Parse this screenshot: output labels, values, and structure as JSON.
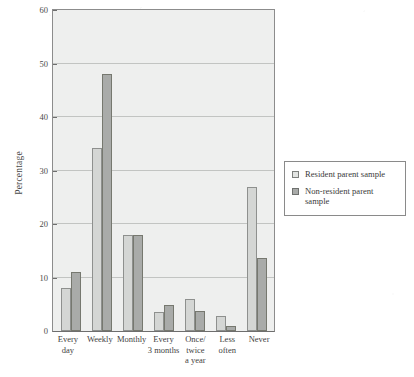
{
  "chart_data": {
    "type": "bar",
    "title": "",
    "xlabel": "",
    "ylabel": "Percentage",
    "ylim": [
      0,
      60
    ],
    "yticks": [
      0,
      10,
      20,
      30,
      40,
      50,
      60
    ],
    "grid": true,
    "legend_position": "right",
    "categories": [
      "Every day",
      "Weekly",
      "Monthly",
      "Every 3 months",
      "Once/ twice a year",
      "Less often",
      "Never"
    ],
    "category_lines": [
      [
        "Every",
        "day"
      ],
      [
        "Weekly"
      ],
      [
        "Monthly"
      ],
      [
        "Every",
        "3 months"
      ],
      [
        "Once/",
        "twice",
        "a year"
      ],
      [
        "Less",
        "often"
      ],
      [
        "Never"
      ]
    ],
    "series": [
      {
        "name": "Resident parent sample",
        "color": "#d4d6d4",
        "values": [
          8.0,
          34.0,
          17.8,
          3.6,
          5.9,
          2.8,
          26.7
        ]
      },
      {
        "name": "Non-resident parent sample",
        "color": "#a9aba9",
        "values": [
          11.0,
          47.8,
          17.8,
          4.8,
          3.7,
          0.9,
          13.6
        ]
      }
    ]
  },
  "legend": {
    "entries": [
      {
        "label": "Resident parent sample",
        "swatch": "light-gray-square-icon"
      },
      {
        "label": "Non-resident parent sample",
        "swatch": "dark-gray-square-icon"
      }
    ]
  },
  "axis": {
    "y_title": "Percentage"
  }
}
